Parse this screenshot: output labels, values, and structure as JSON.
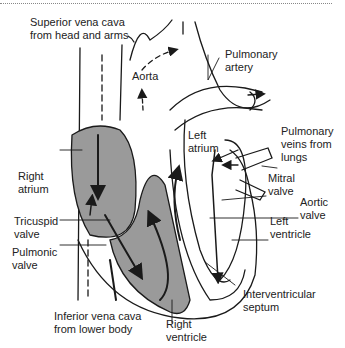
{
  "diagram": {
    "type": "anatomical-diagram",
    "colors": {
      "chamber_fill": "#9a9a9a",
      "line": "#1a1a1a",
      "background": "#ffffff"
    },
    "labels": {
      "superior_vena_cava": "Superior vena cava\nfrom head and arms",
      "pulmonary_artery": "Pulmonary\nartery",
      "aorta": "Aorta",
      "left_atrium": "Left\natrium",
      "pulmonary_veins": "Pulmonary\nveins from\nlungs",
      "right_atrium": "Right\natrium",
      "mitral_valve": "Mitral\nvalve",
      "aortic_valve": "Aortic\nvalve",
      "tricuspid_valve": "Tricuspid\nvalve",
      "left_ventricle": "Left\nventricle",
      "pulmonic_valve": "Pulmonic\nvalve",
      "interventricular_septum": "Interventricular\nseptum",
      "inferior_vena_cava": "Inferior vena cava\nfrom lower body",
      "right_ventricle": "Right\nventricle"
    }
  }
}
